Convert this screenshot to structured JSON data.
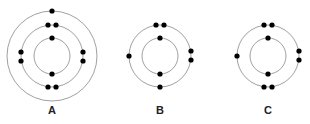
{
  "diagram": {
    "type": "bohr-atom-models",
    "atoms": [
      {
        "label": "A",
        "cx": 52,
        "cy": 56,
        "shells": [
          {
            "r": 18,
            "electrons": 2
          },
          {
            "r": 31,
            "electrons": 8
          },
          {
            "r": 45,
            "electrons": 1
          }
        ]
      },
      {
        "label": "B",
        "cx": 160,
        "cy": 56,
        "shells": [
          {
            "r": 18,
            "electrons": 2
          },
          {
            "r": 31,
            "electrons": 6
          }
        ]
      },
      {
        "label": "C",
        "cx": 268,
        "cy": 56,
        "shells": [
          {
            "r": 18,
            "electrons": 2
          },
          {
            "r": 31,
            "electrons": 7
          }
        ]
      }
    ],
    "colors": {
      "orbit": "#888888",
      "electron": "#000000",
      "label": "#222222"
    }
  }
}
